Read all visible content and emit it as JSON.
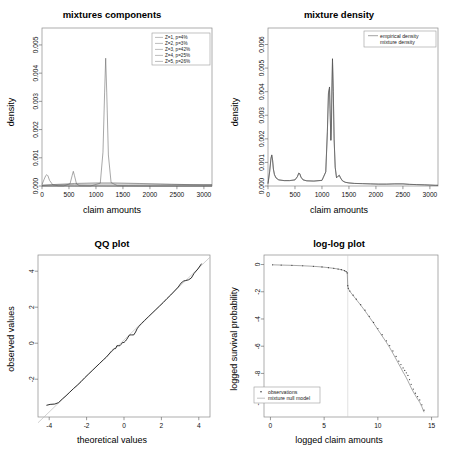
{
  "figure": {
    "panels": [
      "mixtures components",
      "mixture density",
      "QQ plot",
      "log-log plot"
    ]
  },
  "chart_data": [
    {
      "type": "line",
      "title": "mixtures components",
      "xlabel": "claim amounts",
      "ylabel": "density",
      "xlim": [
        0,
        3150
      ],
      "ylim": [
        0,
        0.0056
      ],
      "xticks": [
        0,
        500,
        1000,
        1500,
        2000,
        2500,
        3000
      ],
      "yticks": [
        0.0,
        0.001,
        0.002,
        0.003,
        0.004,
        0.005
      ],
      "ytick_labels": [
        "0.000",
        "0.001",
        "0.002",
        "0.003",
        "0.004",
        "0.005"
      ],
      "grid": false,
      "legend_position": "top-right",
      "legend": [
        {
          "label": "Z=1, p=4%",
          "weight": 0.04,
          "mean": 90,
          "sd": 40,
          "peak": 0.0004
        },
        {
          "label": "Z=2, p=3%",
          "weight": 0.03,
          "mean": 580,
          "sd": 22,
          "peak": 0.00052
        },
        {
          "label": "Z=3, p=42%",
          "weight": 0.42,
          "mean": 1180,
          "sd": 37,
          "peak": 0.00453
        },
        {
          "label": "Z=4, p=25%",
          "weight": 0.25,
          "mean": 1330,
          "sd": 900,
          "peak": 0.00011
        },
        {
          "label": "Z=5, p=26%",
          "weight": 0.26,
          "mean": 1600,
          "sd": 1400,
          "peak": 7e-05
        }
      ],
      "series": [
        {
          "name": "Z=1, p=4%",
          "x": [
            0,
            40,
            70,
            90,
            110,
            140,
            200,
            300,
            600,
            1200,
            2000,
            3000,
            3150
          ],
          "values": [
            5e-05,
            0.00024,
            0.00037,
            0.0004,
            0.00036,
            0.0002,
            4e-05,
            1e-05,
            0,
            0,
            0,
            0,
            0
          ]
        },
        {
          "name": "Z=2, p=3%",
          "x": [
            0,
            400,
            520,
            560,
            580,
            600,
            640,
            700,
            1200,
            2000,
            3000,
            3150
          ],
          "values": [
            0,
            0,
            8e-05,
            0.00038,
            0.00052,
            0.00038,
            7e-05,
            1e-05,
            0,
            0,
            0,
            0
          ]
        },
        {
          "name": "Z=3, p=42%",
          "x": [
            0,
            900,
            1080,
            1130,
            1160,
            1180,
            1200,
            1230,
            1280,
            1400,
            2000,
            3000,
            3150
          ],
          "values": [
            0,
            0,
            0.0001,
            0.0012,
            0.0033,
            0.00453,
            0.0033,
            0.0011,
            0.00012,
            1e-05,
            0,
            0,
            0
          ]
        },
        {
          "name": "Z=4, p=25%",
          "x": [
            0,
            200,
            600,
            1000,
            1330,
            1800,
            2400,
            3000,
            3150
          ],
          "values": [
            2e-05,
            5e-05,
            9e-05,
            0.00011,
            0.00011,
            9e-05,
            6e-05,
            4e-05,
            4e-05
          ]
        },
        {
          "name": "Z=5, p=26%",
          "x": [
            0,
            200,
            600,
            1000,
            1600,
            2200,
            2800,
            3150
          ],
          "values": [
            3e-05,
            4e-05,
            6e-05,
            7e-05,
            7e-05,
            6e-05,
            5e-05,
            5e-05
          ]
        }
      ]
    },
    {
      "type": "line",
      "title": "mixture density",
      "xlabel": "claim amounts",
      "ylabel": "density",
      "xlim": [
        0,
        3150
      ],
      "ylim": [
        0,
        0.0067
      ],
      "xticks": [
        0,
        500,
        1000,
        1500,
        2000,
        2500,
        3000
      ],
      "yticks": [
        0.0,
        0.001,
        0.002,
        0.003,
        0.004,
        0.005,
        0.006
      ],
      "ytick_labels": [
        "0.000",
        "0.001",
        "0.002",
        "0.003",
        "0.004",
        "0.005",
        "0.006"
      ],
      "grid": false,
      "legend_position": "top-right",
      "legend": [
        "empirical density",
        "mixture density"
      ],
      "series": [
        {
          "name": "empirical density",
          "x": [
            0,
            30,
            55,
            70,
            85,
            100,
            120,
            150,
            200,
            300,
            400,
            500,
            545,
            570,
            590,
            610,
            650,
            720,
            850,
            1000,
            1070,
            1100,
            1120,
            1140,
            1150,
            1165,
            1175,
            1185,
            1195,
            1210,
            1225,
            1245,
            1270,
            1300,
            1320,
            1345,
            1380,
            1430,
            1500,
            1600,
            1750,
            1900,
            2050,
            2200,
            2350,
            2500,
            2620,
            2750,
            2900,
            3000,
            3100,
            3150
          ],
          "values": [
            0.0001,
            0.0006,
            0.00118,
            0.00132,
            0.0011,
            0.00072,
            0.00048,
            0.00034,
            0.00026,
            0.00023,
            0.00023,
            0.00026,
            0.0004,
            0.00055,
            0.00052,
            0.00038,
            0.00026,
            0.00022,
            0.00021,
            0.00024,
            0.0006,
            0.0023,
            0.00395,
            0.0042,
            0.0033,
            0.00195,
            0.0025,
            0.0042,
            0.0054,
            0.004,
            0.002,
            0.0008,
            0.00035,
            0.00042,
            0.00046,
            0.00034,
            0.00022,
            0.00016,
            0.00013,
            0.00011,
            0.0001,
            9e-05,
            8e-05,
            8e-05,
            9e-05,
            9e-05,
            7e-05,
            6e-05,
            5e-05,
            4e-05,
            3e-05,
            3e-05
          ]
        }
      ]
    },
    {
      "type": "scatter",
      "title": "QQ plot",
      "xlabel": "theoretical values",
      "ylabel": "observed values",
      "xlim": [
        -4.6,
        4.6
      ],
      "ylim": [
        -4.1,
        4.9
      ],
      "xticks": [
        -4,
        -2,
        0,
        2,
        4
      ],
      "yticks": [
        -2,
        0,
        2,
        4
      ],
      "grid": false,
      "reference_line": {
        "slope": 1,
        "intercept": 0.18
      },
      "points_x": [
        -4.15,
        -3.95,
        -3.7,
        -3.5,
        -3.3,
        -3.1,
        -2.9,
        -2.7,
        -2.5,
        -2.3,
        -2.1,
        -1.9,
        -1.7,
        -1.5,
        -1.3,
        -1.1,
        -0.95,
        -0.8,
        -0.65,
        -0.52,
        -0.45,
        -0.38,
        -0.3,
        -0.22,
        -0.15,
        -0.08,
        0.0,
        0.08,
        0.15,
        0.22,
        0.3,
        0.4,
        0.52,
        0.62,
        0.7,
        0.8,
        0.95,
        1.1,
        1.3,
        1.5,
        1.7,
        1.9,
        2.1,
        2.3,
        2.5,
        2.7,
        2.9,
        3.05,
        3.2,
        3.3,
        3.45,
        3.6,
        3.75,
        3.95,
        4.15
      ],
      "points_y": [
        -3.45,
        -3.4,
        -3.38,
        -3.3,
        -3.1,
        -2.92,
        -2.72,
        -2.52,
        -2.34,
        -2.14,
        -1.92,
        -1.72,
        -1.52,
        -1.32,
        -1.12,
        -0.92,
        -0.78,
        -0.6,
        -0.42,
        -0.3,
        -0.3,
        -0.14,
        -0.14,
        -0.14,
        -0.06,
        0.04,
        0.04,
        0.12,
        0.22,
        0.34,
        0.46,
        0.46,
        0.46,
        0.62,
        0.8,
        0.94,
        1.1,
        1.26,
        1.46,
        1.66,
        1.86,
        2.06,
        2.26,
        2.48,
        2.68,
        2.9,
        3.12,
        3.34,
        3.46,
        3.48,
        3.52,
        3.62,
        3.88,
        4.12,
        4.42
      ]
    },
    {
      "type": "line",
      "title": "log-log plot",
      "xlabel": "logged claim amounts",
      "ylabel": "logged survival probability",
      "xlim": [
        -0.6,
        15.6
      ],
      "ylim": [
        -11.2,
        0.7
      ],
      "xticks": [
        0,
        5,
        10,
        15
      ],
      "yticks": [
        0,
        -2,
        -4,
        -6,
        -8,
        -10
      ],
      "grid": false,
      "legend_position": "bottom-left",
      "legend": [
        "observations",
        "mixture null model"
      ],
      "vline_x": 7.2,
      "series": [
        {
          "name": "observations",
          "x": [
            0.2,
            1.0,
            2.0,
            3.0,
            4.0,
            4.8,
            5.4,
            5.9,
            6.3,
            6.6,
            6.9,
            7.05,
            7.15,
            7.2,
            7.25,
            7.4,
            7.7,
            8.0,
            8.4,
            8.8,
            9.2,
            9.6,
            10.0,
            10.4,
            10.8,
            11.1,
            11.4,
            11.7,
            11.95,
            12.15,
            12.35,
            12.5,
            12.65,
            12.8,
            12.95,
            13.1,
            13.3,
            13.5,
            13.7,
            13.9,
            14.1,
            14.3
          ],
          "values": [
            -0.02,
            -0.04,
            -0.06,
            -0.09,
            -0.13,
            -0.18,
            -0.23,
            -0.28,
            -0.33,
            -0.38,
            -0.45,
            -0.52,
            -0.62,
            -1.55,
            -1.75,
            -1.95,
            -2.25,
            -2.55,
            -2.95,
            -3.35,
            -3.8,
            -4.25,
            -4.7,
            -5.15,
            -5.6,
            -5.95,
            -6.35,
            -6.75,
            -7.1,
            -7.35,
            -7.6,
            -7.78,
            -7.95,
            -8.15,
            -8.45,
            -8.8,
            -9.15,
            -9.45,
            -9.7,
            -9.95,
            -10.3,
            -10.7
          ]
        },
        {
          "name": "mixture null model",
          "x": [
            0.2,
            1.0,
            2.0,
            3.0,
            4.0,
            4.8,
            5.4,
            5.9,
            6.3,
            6.6,
            6.9,
            7.05,
            7.15,
            7.2,
            7.25,
            7.4,
            7.7,
            8.0,
            8.4,
            8.8,
            9.2,
            9.6,
            10.0,
            10.4,
            10.8,
            11.1,
            11.4,
            11.7,
            11.95,
            12.15,
            12.35,
            12.5,
            12.65,
            12.8,
            12.95,
            13.1,
            13.3,
            13.5,
            13.7,
            13.9,
            14.1,
            14.3
          ],
          "values": [
            -0.02,
            -0.04,
            -0.06,
            -0.09,
            -0.13,
            -0.18,
            -0.23,
            -0.28,
            -0.33,
            -0.38,
            -0.45,
            -0.52,
            -0.62,
            -1.58,
            -1.78,
            -1.98,
            -2.28,
            -2.58,
            -2.98,
            -3.4,
            -3.85,
            -4.3,
            -4.78,
            -5.25,
            -5.72,
            -6.1,
            -6.52,
            -6.95,
            -7.32,
            -7.6,
            -7.9,
            -8.1,
            -8.32,
            -8.55,
            -8.8,
            -9.05,
            -9.35,
            -9.62,
            -9.88,
            -10.12,
            -10.45,
            -10.85
          ]
        }
      ]
    }
  ]
}
